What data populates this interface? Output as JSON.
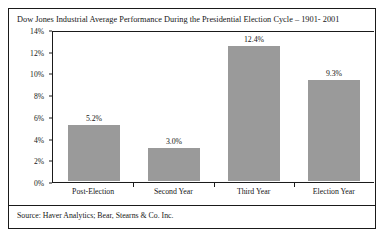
{
  "chart_data": {
    "type": "bar",
    "title": "Dow Jones Industrial Average Performance During the Presidential Election Cycle – 1901- 2001",
    "categories": [
      "Post-Election",
      "Second Year",
      "Third Year",
      "Election Year"
    ],
    "values": [
      5.2,
      3.0,
      12.4,
      9.3
    ],
    "value_labels": [
      "5.2%",
      "3.0%",
      "12.4%",
      "9.3%"
    ],
    "xlabel": "",
    "ylabel": "",
    "ylim": [
      0,
      14
    ],
    "ytick_labels": [
      "0%",
      "2%",
      "4%",
      "6%",
      "8%",
      "10%",
      "12%",
      "14%"
    ],
    "ytick_values": [
      0,
      2,
      4,
      6,
      8,
      10,
      12,
      14
    ],
    "grid": false,
    "legend": false,
    "bar_color": "#9a9a9a",
    "axis_color": "#1a1a1a",
    "text_color": "#161616",
    "source": "Source: Haver Analytics; Bear, Stearns & Co. Inc."
  }
}
